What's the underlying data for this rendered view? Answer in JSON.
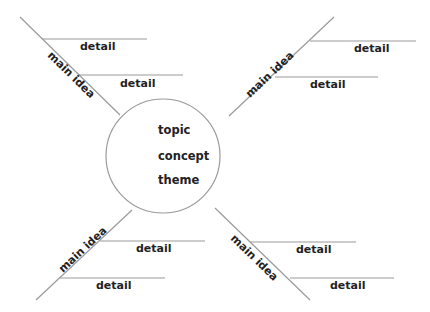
{
  "diagram": {
    "type": "spider-map",
    "center": {
      "lines": [
        "topic",
        "concept",
        "theme"
      ]
    },
    "branches": [
      {
        "position": "top-left",
        "label": "main idea",
        "details": [
          "detail",
          "detail"
        ]
      },
      {
        "position": "top-right",
        "label": "main idea",
        "details": [
          "detail",
          "detail"
        ]
      },
      {
        "position": "bottom-left",
        "label": "main idea",
        "details": [
          "detail",
          "detail"
        ]
      },
      {
        "position": "bottom-right",
        "label": "main idea",
        "details": [
          "detail",
          "detail"
        ]
      }
    ],
    "colors": {
      "line": "#9a9a9a",
      "text": "#222222",
      "background": "#ffffff"
    }
  }
}
